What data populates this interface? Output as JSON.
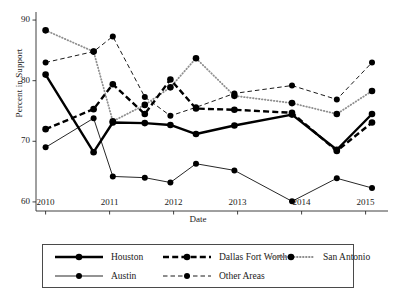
{
  "chart_data": {
    "type": "line",
    "title": "",
    "xlabel": "Date",
    "ylabel": "Percent in Support",
    "xlim": [
      2009.85,
      2015.35
    ],
    "ylim": [
      58.5,
      91.0
    ],
    "xticks": [
      "2010",
      "2011",
      "2012",
      "2013",
      "2014",
      "2015"
    ],
    "yticks": [
      "60",
      "70",
      "80",
      "90"
    ],
    "grid": false,
    "legend_position": "bottom",
    "series": [
      {
        "name": "Houston",
        "style": "solid-thick",
        "x": [
          2010.0,
          2010.75,
          2011.05,
          2011.55,
          2011.95,
          2012.35,
          2012.95,
          2013.85,
          2014.55,
          2015.1
        ],
        "y": [
          81.0,
          68.2,
          73.1,
          73.0,
          72.7,
          71.2,
          72.6,
          74.4,
          68.6,
          74.5
        ]
      },
      {
        "name": "Dallas Fort Worth",
        "style": "dashed-thick",
        "x": [
          2010.0,
          2010.75,
          2011.05,
          2011.55,
          2011.95,
          2012.35,
          2012.95,
          2013.85,
          2014.55,
          2015.1
        ],
        "y": [
          72.0,
          75.3,
          79.4,
          74.5,
          80.2,
          75.4,
          75.2,
          74.7,
          68.4,
          73.1
        ]
      },
      {
        "name": "San Antonio",
        "style": "dotted",
        "x": [
          2010.0,
          2010.75,
          2011.05,
          2011.55,
          2011.95,
          2012.35,
          2012.95,
          2013.85,
          2014.55,
          2015.1
        ],
        "y": [
          88.3,
          84.8,
          73.3,
          76.0,
          78.9,
          83.7,
          77.5,
          76.3,
          74.5,
          78.3
        ]
      },
      {
        "name": "Austin",
        "style": "solid-thin",
        "x": [
          2010.0,
          2010.75,
          2011.05,
          2011.55,
          2011.95,
          2012.35,
          2012.95,
          2013.85,
          2014.55,
          2015.1
        ],
        "y": [
          69.0,
          73.8,
          64.2,
          64.0,
          63.2,
          66.3,
          65.2,
          60.1,
          63.9,
          62.3
        ]
      },
      {
        "name": "Other Areas",
        "style": "dashed-thin",
        "x": [
          2010.0,
          2010.75,
          2011.05,
          2011.55,
          2011.95,
          2012.35,
          2012.95,
          2013.85,
          2014.55,
          2015.1
        ],
        "y": [
          83.0,
          84.8,
          87.3,
          77.3,
          74.2,
          75.6,
          77.9,
          79.2,
          76.9,
          83.0
        ]
      }
    ]
  },
  "legend": {
    "rows": [
      [
        {
          "label": "Houston",
          "style": "solid-thick"
        },
        {
          "label": "Dallas Fort Worth",
          "style": "dashed-thick"
        },
        {
          "label": "San Antonio",
          "style": "dotted"
        }
      ],
      [
        {
          "label": "Austin",
          "style": "solid-thin"
        },
        {
          "label": "Other Areas",
          "style": "dashed-thin"
        }
      ]
    ]
  }
}
